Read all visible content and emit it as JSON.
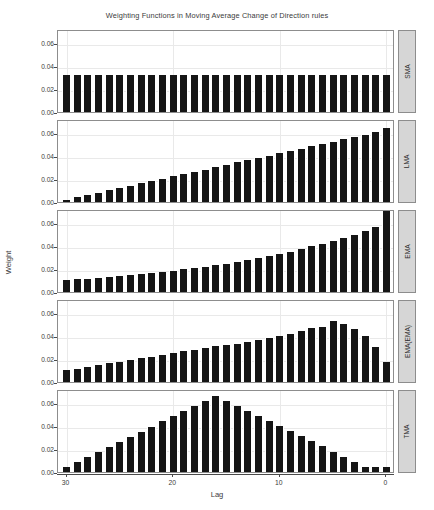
{
  "chart_data": {
    "type": "bar",
    "title": "Weighting Functions in Moving Average Change of Direction rules",
    "xlabel": "Lag",
    "ylabel": "Weight",
    "xlim": [
      30.8,
      -0.8
    ],
    "x_reversed": true,
    "ylim": [
      0,
      0.072
    ],
    "grid": true,
    "legend": "none",
    "panel_layout": "5 rows x 1 column, shared axes, strip labels on right",
    "y_ticks": [
      0.0,
      0.02,
      0.04,
      0.06
    ],
    "y_tick_labels": [
      "0.00",
      "0.02",
      "0.04",
      "0.06"
    ],
    "x_ticks": [
      30,
      20,
      10,
      0
    ],
    "x_tick_labels": [
      "30",
      "20",
      "10",
      "0"
    ],
    "x": [
      30,
      29,
      28,
      27,
      26,
      25,
      24,
      23,
      22,
      21,
      20,
      19,
      18,
      17,
      16,
      15,
      14,
      13,
      12,
      11,
      10,
      9,
      8,
      7,
      6,
      5,
      4,
      3,
      2,
      1,
      0
    ],
    "panels": [
      {
        "label": "SMA",
        "values": [
          0.0323,
          0.0323,
          0.0323,
          0.0323,
          0.0323,
          0.0323,
          0.0323,
          0.0323,
          0.0323,
          0.0323,
          0.0323,
          0.0323,
          0.0323,
          0.0323,
          0.0323,
          0.0323,
          0.0323,
          0.0323,
          0.0323,
          0.0323,
          0.0323,
          0.0323,
          0.0323,
          0.0323,
          0.0323,
          0.0323,
          0.0323,
          0.0323,
          0.0323,
          0.0323,
          0.0323
        ]
      },
      {
        "label": "LMA",
        "values": [
          0.002,
          0.004,
          0.006,
          0.0081,
          0.0101,
          0.0121,
          0.0141,
          0.0161,
          0.0181,
          0.0202,
          0.0222,
          0.0242,
          0.0262,
          0.0282,
          0.0302,
          0.0323,
          0.0343,
          0.0363,
          0.0383,
          0.0403,
          0.0423,
          0.0444,
          0.0464,
          0.0484,
          0.0504,
          0.0524,
          0.0544,
          0.0565,
          0.0585,
          0.0605,
          0.0645
        ]
      },
      {
        "label": "EMA",
        "values": [
          0.0102,
          0.0109,
          0.0115,
          0.0122,
          0.013,
          0.0138,
          0.0146,
          0.0155,
          0.0164,
          0.0174,
          0.0184,
          0.0196,
          0.0207,
          0.022,
          0.0233,
          0.0247,
          0.0262,
          0.0278,
          0.0295,
          0.0312,
          0.0331,
          0.0351,
          0.0372,
          0.0395,
          0.0418,
          0.0443,
          0.047,
          0.0498,
          0.0528,
          0.056,
          0.07
        ]
      },
      {
        "label": "EMA(EMA)",
        "values": [
          0.01,
          0.0116,
          0.0131,
          0.0146,
          0.0161,
          0.0175,
          0.019,
          0.0207,
          0.0221,
          0.0236,
          0.0249,
          0.0268,
          0.0281,
          0.0295,
          0.0314,
          0.032,
          0.0333,
          0.0347,
          0.0363,
          0.0381,
          0.0396,
          0.042,
          0.0443,
          0.0465,
          0.0481,
          0.05,
          0.0512,
          0.0525,
          0.0532,
          0.0535,
          0.0532
        ]
      },
      {
        "label": "TMA",
        "values": [
          0.004,
          0.0086,
          0.0133,
          0.0176,
          0.0219,
          0.0262,
          0.0308,
          0.0351,
          0.0394,
          0.044,
          0.0483,
          0.053,
          0.0573,
          0.0615,
          0.066,
          0.062,
          0.0577,
          0.0533,
          0.0487,
          0.0444,
          0.04,
          0.0355,
          0.031,
          0.0266,
          0.0222,
          0.0176,
          0.0133,
          0.0089,
          0.004,
          0.004,
          0.004
        ]
      }
    ]
  },
  "panel_tail_overrides": {
    "ema_ema_tail": [
      0.053,
      0.05,
      0.046,
      0.04,
      0.0305,
      0.0175
    ],
    "tma_note": "symmetric triangle peaking near lag 15"
  },
  "colors": {
    "bar": "#151515",
    "panel_border": "#8d8d8d",
    "strip_bg": "#d6d6d6",
    "grid": "#e9e9e9",
    "text": "#3c3c3c",
    "background": "#ffffff"
  },
  "icons": {
    "none": ""
  }
}
